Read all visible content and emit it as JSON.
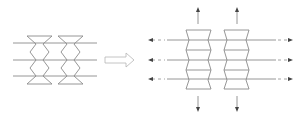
{
  "figure": {
    "left_panel": {
      "label": "undeformed-lattice",
      "columns": 2,
      "rows": 3,
      "stroke_color": "#8a8a8a"
    },
    "transition_arrow": {
      "direction": "right",
      "style": "hollow",
      "stroke_color": "#b5b5b5"
    },
    "right_panel": {
      "label": "expanded-lattice",
      "columns": 2,
      "rows": 3,
      "horizontal_arrows": [
        "left",
        "right"
      ],
      "vertical_arrows": [
        "up",
        "down"
      ],
      "arrow_color": "#444444"
    }
  }
}
